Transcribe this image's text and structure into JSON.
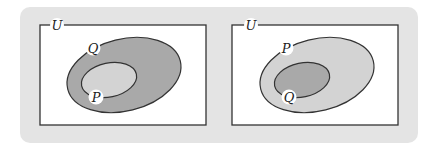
{
  "diagrams": [
    {
      "universe_label": "U",
      "outer_set": {
        "label": "Q",
        "fill": "#a9a9a9"
      },
      "inner_set": {
        "label": "P",
        "fill": "#d3d3d3"
      }
    },
    {
      "universe_label": "U",
      "outer_set": {
        "label": "P",
        "fill": "#d3d3d3"
      },
      "inner_set": {
        "label": "Q",
        "fill": "#a9a9a9"
      }
    }
  ],
  "colors": {
    "panel_background": "#e4e4e4",
    "universe_fill": "#ffffff",
    "stroke": "#333333"
  }
}
